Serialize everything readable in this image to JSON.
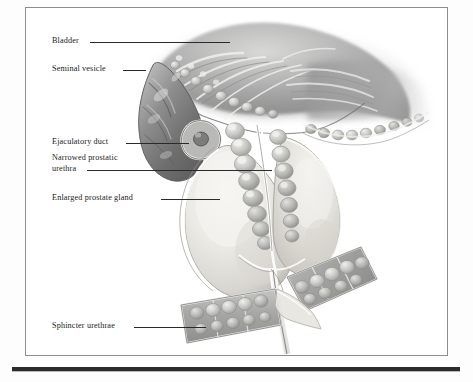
{
  "figure": {
    "type": "anatomical-illustration",
    "style": "grayscale medical airbrush illustration",
    "frame": {
      "border_color": "#8d8d8d",
      "background": "#ffffff"
    },
    "bottom_rule_color": "#2b2b2b"
  },
  "labels": [
    {
      "id": "bladder",
      "text": "Bladder"
    },
    {
      "id": "seminal-vesicle",
      "text": "Seminal vesicle"
    },
    {
      "id": "ejaculatory-duct",
      "text": "Ejaculatory duct"
    },
    {
      "id": "narrowed-urethra",
      "text": "Narrowed prostatic\nurethra"
    },
    {
      "id": "enlarged-prostate",
      "text": "Enlarged prostate gland"
    },
    {
      "id": "sphincter-urethrae",
      "text": "Sphincter urethrae"
    }
  ],
  "palette": {
    "tissue_dark": "#6f6f6f",
    "tissue_mid": "#9a9a9a",
    "tissue_light": "#c9c9c9",
    "prostate_pale": "#e9e8e4",
    "highlight": "#f5f5f3",
    "outline": "#5a5a5a",
    "text": "#1b1b1b",
    "leader": "#2a2a2a"
  }
}
